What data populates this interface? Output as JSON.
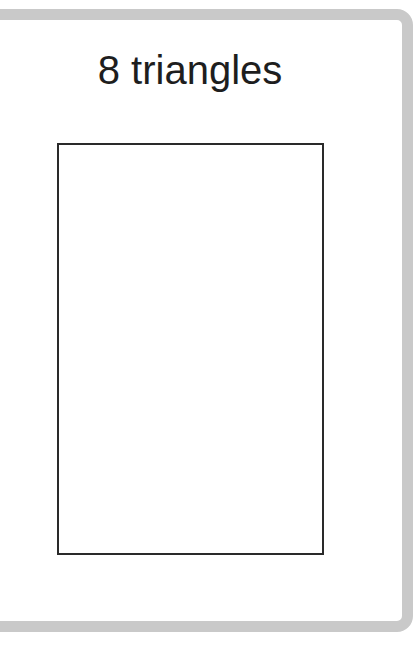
{
  "card": {
    "title": "8 triangles",
    "shape": "rectangle",
    "border_color": "#c9c9c9",
    "outline_color": "#2a2a2a"
  }
}
